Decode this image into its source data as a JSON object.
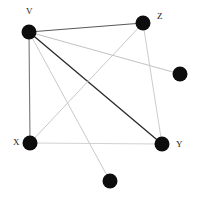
{
  "figure": {
    "background_color": "#ffffff",
    "width": 198,
    "height": 203
  },
  "chart_data": {
    "type": "scatter",
    "title": "",
    "xlabel": "",
    "ylabel": "",
    "grid": false,
    "legend": false,
    "xlim": [
      0,
      198
    ],
    "ylim": [
      0,
      203
    ],
    "node_color": "#0d0d0d",
    "node_radius": 7.5,
    "nodes": [
      {
        "id": "V",
        "label": "V",
        "x": 29,
        "y": 32,
        "label_x": 26,
        "label_y": 14,
        "labeled": true
      },
      {
        "id": "Z",
        "label": "Z",
        "x": 143,
        "y": 23,
        "label_x": 157,
        "label_y": 19,
        "labeled": true
      },
      {
        "id": "R",
        "label": "",
        "x": 180,
        "y": 74,
        "label_x": 0,
        "label_y": 0,
        "labeled": false
      },
      {
        "id": "X",
        "label": "X",
        "x": 30,
        "y": 143,
        "label_x": 13,
        "label_y": 145,
        "labeled": true
      },
      {
        "id": "Y",
        "label": "Y",
        "x": 162,
        "y": 144,
        "label_x": 176,
        "label_y": 147,
        "labeled": true
      },
      {
        "id": "B",
        "label": "",
        "x": 110,
        "y": 181,
        "label_x": 0,
        "label_y": 0,
        "labeled": false
      }
    ],
    "edges": [
      {
        "source": "V",
        "target": "Z",
        "color": "#595959",
        "width": 1.1
      },
      {
        "source": "V",
        "target": "X",
        "color": "#777777",
        "width": 1.1
      },
      {
        "source": "V",
        "target": "Y",
        "color": "#2b2b2b",
        "width": 1.3
      },
      {
        "source": "V",
        "target": "R",
        "color": "#c2c2c2",
        "width": 1.0
      },
      {
        "source": "V",
        "target": "B",
        "color": "#c9c9c9",
        "width": 1.0
      },
      {
        "source": "Z",
        "target": "X",
        "color": "#c9c9c9",
        "width": 1.0
      },
      {
        "source": "Z",
        "target": "Y",
        "color": "#cccccc",
        "width": 1.0
      },
      {
        "source": "X",
        "target": "Y",
        "color": "#d2d2d2",
        "width": 1.0
      }
    ]
  }
}
